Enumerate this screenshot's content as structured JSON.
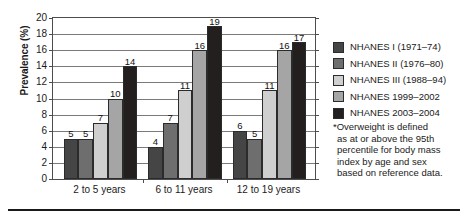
{
  "chart_data": {
    "type": "bar",
    "title": "",
    "xlabel": "",
    "ylabel": "Prevalence (%)",
    "ylim": [
      0,
      20
    ],
    "ytick_step": 2,
    "yticks": [
      20,
      18,
      16,
      14,
      12,
      10,
      8,
      6,
      4,
      2,
      0
    ],
    "grid": true,
    "legend_position": "right",
    "categories": [
      "2 to 5 years",
      "6 to 11 years",
      "12 to 19 years"
    ],
    "series": [
      {
        "name": "NHANES I (1971–74)",
        "color": "#454545",
        "values": [
          5,
          4,
          6
        ]
      },
      {
        "name": "NHANES II (1976–80)",
        "color": "#6e6e6e",
        "values": [
          5,
          7,
          5
        ]
      },
      {
        "name": "NHANES III (1988–94)",
        "color": "#cfcfcf",
        "values": [
          7,
          11,
          11
        ]
      },
      {
        "name": "NHANES 1999–2002",
        "color": "#a5a5a5",
        "values": [
          10,
          16,
          16
        ]
      },
      {
        "name": "NHANES 2003–2004",
        "color": "#231f1f",
        "values": [
          14,
          19,
          17
        ]
      }
    ],
    "bar_labels": {
      "group_1": [
        "5",
        "5",
        "7",
        "10",
        "14"
      ],
      "group_2": [
        "4",
        "7",
        "11",
        "16",
        "19"
      ],
      "group_3": [
        "6",
        "5",
        "11",
        "16",
        "17"
      ]
    }
  },
  "footnote": {
    "lines": [
      "*Overweight is defined",
      "as at or above the 95th",
      "percentile for body mass",
      "index by age and sex",
      "based on reference data."
    ]
  }
}
